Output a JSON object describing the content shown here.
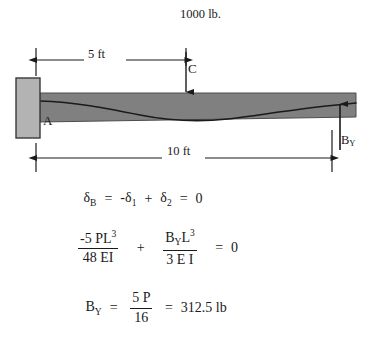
{
  "figure": {
    "type": "propped-cantilever-beam-deflection",
    "diagram": {
      "load_label": "1000 lb.",
      "dimension_5ft": "5 ft",
      "dimension_10ft": "10 ft",
      "point_c": "C",
      "point_a": "A",
      "reaction_label": "B",
      "reaction_subscript": "Y",
      "beam_color": "#808080",
      "support_color": "#b3b3b3",
      "line_color": "#1a1a1a"
    },
    "equations": {
      "line1": {
        "lhs_symbol": "δ",
        "lhs_sub": "B",
        "eq1": "=",
        "term1": "-δ",
        "term1_sub": "1",
        "plus": "+",
        "term2": "δ",
        "term2_sub": "2",
        "eq2": "=",
        "rhs": "0"
      },
      "line2": {
        "frac1_num_a": "-5 PL",
        "frac1_num_sup": "3",
        "frac1_den": "48 EI",
        "plus": "+",
        "frac2_num_a": "B",
        "frac2_num_sub": "Y",
        "frac2_num_b": "L",
        "frac2_num_sup": "3",
        "frac2_den": "3 E I",
        "eq": "=",
        "rhs": "0"
      },
      "line3": {
        "lhs": "B",
        "lhs_sub": "Y",
        "eq1": "=",
        "frac_num": "5 P",
        "frac_den": "16",
        "eq2": "=",
        "result": "312.5 lb"
      }
    }
  }
}
